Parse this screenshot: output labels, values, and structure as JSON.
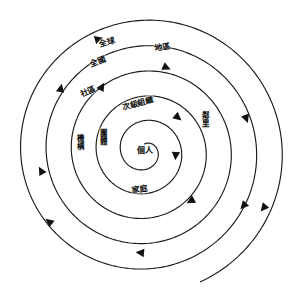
{
  "diagram": {
    "type": "concentric-spiral",
    "title": "",
    "center": {
      "x": 145,
      "y": 151
    },
    "stroke_color": "#1a1a1a",
    "arrow_color": "#111111",
    "background_color": "#ffffff",
    "spiral": {
      "turns": 5.45,
      "start_radius": 7,
      "end_radius": 142,
      "start_angle_deg": 95,
      "direction": "counterclockwise-outward"
    },
    "labels": [
      {
        "id": "individual",
        "text": "個人",
        "x": 145,
        "y": 151,
        "rotate": 0,
        "vertical": false,
        "level": 1
      },
      {
        "id": "family",
        "text": "家庭",
        "x": 140,
        "y": 190,
        "rotate": -8,
        "vertical": false,
        "level": 2
      },
      {
        "id": "group",
        "text": "團體",
        "x": 103,
        "y": 137,
        "rotate": 0,
        "vertical": true,
        "level": 3
      },
      {
        "id": "institution",
        "text": "機構",
        "x": 80,
        "y": 142,
        "rotate": 0,
        "vertical": true,
        "level": 4
      },
      {
        "id": "secondary-org",
        "text": "次級組織",
        "x": 138,
        "y": 104,
        "rotate": -14,
        "vertical": false,
        "level": 5
      },
      {
        "id": "neighborhood",
        "text": "鄰里",
        "x": 205,
        "y": 119,
        "rotate": 0,
        "vertical": true,
        "level": 6
      },
      {
        "id": "community",
        "text": "社區",
        "x": 88,
        "y": 92,
        "rotate": -24,
        "vertical": false,
        "level": 7
      },
      {
        "id": "district",
        "text": "地區",
        "x": 163,
        "y": 48,
        "rotate": -10,
        "vertical": false,
        "level": 8
      },
      {
        "id": "national",
        "text": "全國",
        "x": 98,
        "y": 62,
        "rotate": -22,
        "vertical": false,
        "level": 9
      },
      {
        "id": "global",
        "text": "全球",
        "x": 107,
        "y": 43,
        "rotate": -18,
        "vertical": false,
        "level": 10
      }
    ],
    "arrows": [
      {
        "id": "arrow-inner-right",
        "x": 176,
        "y": 152,
        "rotate": 95
      },
      {
        "id": "arrow-inner-upper",
        "x": 175,
        "y": 115,
        "rotate": 40
      },
      {
        "id": "arrow-mid-lower-right",
        "x": 194,
        "y": 199,
        "rotate": 150
      },
      {
        "id": "arrow-mid-upper-left",
        "x": 100,
        "y": 90,
        "rotate": 300
      },
      {
        "id": "arrow-mid-left",
        "x": 60,
        "y": 92,
        "rotate": 282
      },
      {
        "id": "arrow-mid-bottom",
        "x": 144,
        "y": 253,
        "rotate": 185
      },
      {
        "id": "arrow-outer-left-low",
        "x": 43,
        "y": 174,
        "rotate": 240
      },
      {
        "id": "arrow-outer-left-bottom",
        "x": 52,
        "y": 224,
        "rotate": 218
      },
      {
        "id": "arrow-outer-top",
        "x": 163,
        "y": 66,
        "rotate": 24
      },
      {
        "id": "arrow-outer-right",
        "x": 245,
        "y": 115,
        "rotate": 70
      },
      {
        "id": "arrow-outer-right-low",
        "x": 246,
        "y": 203,
        "rotate": 132
      },
      {
        "id": "arrow-outer-tip",
        "x": 266,
        "y": 205,
        "rotate": 130
      },
      {
        "id": "arrow-top-start",
        "x": 95,
        "y": 40,
        "rotate": 344
      }
    ]
  }
}
